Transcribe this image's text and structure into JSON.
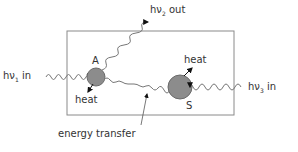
{
  "diagram": {
    "labels": {
      "hv1_in": {
        "h": "hν",
        "sub": "1",
        "suffix": " in"
      },
      "hv2_out": {
        "h": "hν",
        "sub": "2",
        "suffix": " out"
      },
      "hv3_in": {
        "h": "hν",
        "sub": "3",
        "suffix": " in"
      },
      "node_a": "A",
      "node_s": "S",
      "heat_a": "heat",
      "heat_s": "heat",
      "energy_transfer": "energy transfer"
    },
    "colors": {
      "box": "#8a8a8a",
      "circle_fill": "#8c8c8c",
      "circle_stroke": "#6a6a6a",
      "wave": "#777777",
      "arrow": "#111111",
      "text": "#333333"
    }
  }
}
